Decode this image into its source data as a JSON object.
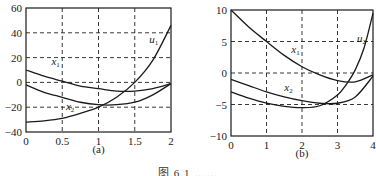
{
  "chart_data": [
    {
      "type": "line",
      "panel_label": "(a)",
      "xlim": [
        0,
        2
      ],
      "ylim": [
        -40,
        60
      ],
      "x_ticks": [
        "0",
        "0.5",
        "1",
        "1.5",
        "2"
      ],
      "y_ticks": [
        "60",
        "40",
        "20",
        "0",
        "-20",
        "-40"
      ],
      "grid": true,
      "grid_style": "dashed",
      "series": [
        {
          "name": "x1",
          "label": "x",
          "sub": "1",
          "x": [
            0,
            0.25,
            0.5,
            0.75,
            1.0,
            1.25,
            1.5,
            1.75,
            2.0
          ],
          "y": [
            10,
            5,
            1,
            -3,
            -5,
            -7,
            -7,
            -5,
            -1
          ]
        },
        {
          "name": "x2",
          "label": "x",
          "sub": "2",
          "x": [
            0,
            0.25,
            0.5,
            0.75,
            1.0,
            1.25,
            1.5,
            1.75,
            2.0
          ],
          "y": [
            -2,
            -8,
            -12,
            -16,
            -18,
            -18,
            -16,
            -10,
            -1
          ]
        },
        {
          "name": "u1",
          "label": "u",
          "sub": "1",
          "x": [
            0,
            0.25,
            0.5,
            0.75,
            1.0,
            1.25,
            1.5,
            1.75,
            2.0
          ],
          "y": [
            -32,
            -31,
            -29,
            -25,
            -20,
            -12,
            0,
            18,
            46
          ]
        }
      ]
    },
    {
      "type": "line",
      "panel_label": "(b)",
      "xlim": [
        0,
        4
      ],
      "ylim": [
        -10,
        10
      ],
      "x_ticks": [
        "0",
        "1",
        "2",
        "3",
        "4"
      ],
      "y_ticks": [
        "10",
        "5",
        "0",
        "-5",
        "-10"
      ],
      "grid": true,
      "grid_style": "dashed",
      "series": [
        {
          "name": "x1",
          "label": "x",
          "sub": "1",
          "x": [
            0,
            0.5,
            1,
            1.5,
            2,
            2.5,
            3,
            3.5,
            4
          ],
          "y": [
            10,
            7.3,
            5,
            2.8,
            1,
            -0.3,
            -1.2,
            -1.4,
            -0.3
          ]
        },
        {
          "name": "x2",
          "label": "x",
          "sub": "2",
          "x": [
            0,
            0.5,
            1,
            1.5,
            2,
            2.5,
            3,
            3.5,
            4
          ],
          "y": [
            -1,
            -2,
            -3,
            -3.8,
            -4.4,
            -4.8,
            -4.8,
            -3.8,
            -0.5
          ]
        },
        {
          "name": "u2",
          "label": "u",
          "sub": "2",
          "x": [
            0,
            0.5,
            1,
            1.5,
            2,
            2.5,
            3,
            3.25,
            3.5,
            3.75,
            4
          ],
          "y": [
            -3,
            -4,
            -4.8,
            -5.3,
            -5.5,
            -5.2,
            -3.5,
            -1.8,
            0.5,
            4,
            9.5
          ]
        }
      ]
    }
  ],
  "caption": "图 6.1  ……"
}
